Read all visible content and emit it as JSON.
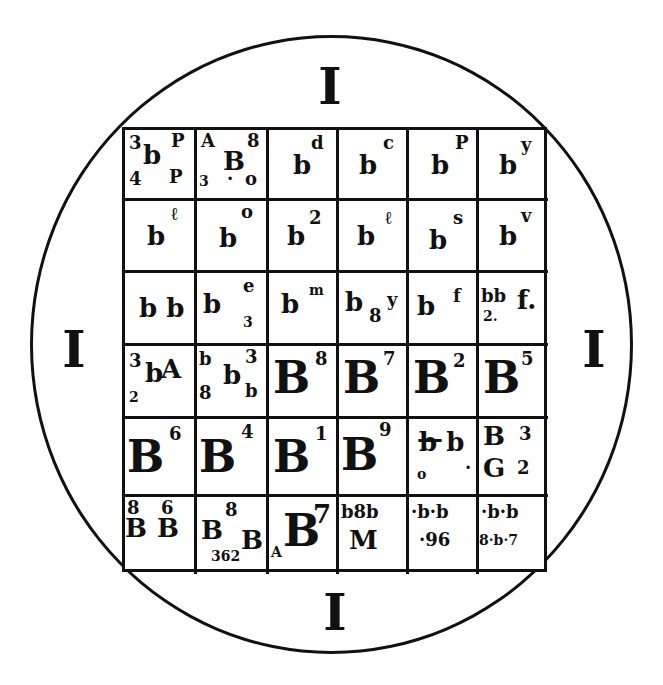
{
  "diagram": {
    "type": "magic-square-seal",
    "outer_shape": "circle",
    "markers": {
      "top": "I",
      "left": "I",
      "right": "I",
      "bottom": "I"
    },
    "grid": {
      "rows": 6,
      "cols": 6,
      "cells": [
        [
          {
            "glyphs": [
              {
                "t": "3",
                "x": 4,
                "y": 4,
                "s": "s-sm"
              },
              {
                "t": "b",
                "x": 18,
                "y": 12,
                "s": "s-mid"
              },
              {
                "t": "P",
                "x": 46,
                "y": 2,
                "s": "s-sm"
              },
              {
                "t": "4",
                "x": 4,
                "y": 40,
                "s": "s-sm"
              },
              {
                "t": "P",
                "x": 44,
                "y": 38,
                "s": "s-sm"
              }
            ]
          },
          {
            "glyphs": [
              {
                "t": "A",
                "x": 4,
                "y": 2,
                "s": "s-sm"
              },
              {
                "t": "8",
                "x": 50,
                "y": 2,
                "s": "s-sm"
              },
              {
                "t": "B",
                "x": 26,
                "y": 18,
                "s": "s-mid"
              },
              {
                "t": "3",
                "x": 2,
                "y": 44,
                "s": "s-xs"
              },
              {
                "t": "·",
                "x": 30,
                "y": 40,
                "s": "s-sm"
              },
              {
                "t": "o",
                "x": 48,
                "y": 40,
                "s": "s-sm"
              }
            ]
          },
          {
            "glyphs": [
              {
                "t": "b",
                "x": 24,
                "y": 22,
                "s": "s-mid"
              },
              {
                "t": "d",
                "x": 42,
                "y": 4,
                "s": "s-sm"
              }
            ]
          },
          {
            "glyphs": [
              {
                "t": "b",
                "x": 20,
                "y": 22,
                "s": "s-mid"
              },
              {
                "t": "c",
                "x": 44,
                "y": 4,
                "s": "s-sm"
              }
            ]
          },
          {
            "glyphs": [
              {
                "t": "b",
                "x": 22,
                "y": 22,
                "s": "s-mid"
              },
              {
                "t": "P",
                "x": 46,
                "y": 4,
                "s": "s-sm"
              }
            ]
          },
          {
            "glyphs": [
              {
                "t": "b",
                "x": 20,
                "y": 22,
                "s": "s-mid"
              },
              {
                "t": "y",
                "x": 42,
                "y": 6,
                "s": "s-sm"
              }
            ]
          }
        ],
        [
          {
            "glyphs": [
              {
                "t": "b",
                "x": 22,
                "y": 22,
                "s": "s-mid"
              },
              {
                "t": "ℓ",
                "x": 46,
                "y": 4,
                "s": "s-sm"
              }
            ]
          },
          {
            "glyphs": [
              {
                "t": "b",
                "x": 22,
                "y": 24,
                "s": "s-mid"
              },
              {
                "t": "o",
                "x": 44,
                "y": 2,
                "s": "s-sm"
              }
            ]
          },
          {
            "glyphs": [
              {
                "t": "b",
                "x": 18,
                "y": 22,
                "s": "s-mid"
              },
              {
                "t": "2",
                "x": 40,
                "y": 8,
                "s": "s-sm"
              }
            ]
          },
          {
            "glyphs": [
              {
                "t": "b",
                "x": 18,
                "y": 22,
                "s": "s-mid"
              },
              {
                "t": "ℓ",
                "x": 46,
                "y": 8,
                "s": "s-sm"
              }
            ]
          },
          {
            "glyphs": [
              {
                "t": "b",
                "x": 20,
                "y": 26,
                "s": "s-mid"
              },
              {
                "t": "s",
                "x": 44,
                "y": 8,
                "s": "s-sm"
              }
            ]
          },
          {
            "glyphs": [
              {
                "t": "b",
                "x": 20,
                "y": 22,
                "s": "s-mid"
              },
              {
                "t": "v",
                "x": 42,
                "y": 6,
                "s": "s-sm"
              }
            ]
          }
        ],
        [
          {
            "glyphs": [
              {
                "t": "b b",
                "x": 14,
                "y": 22,
                "s": "s-mid"
              }
            ]
          },
          {
            "glyphs": [
              {
                "t": "b",
                "x": 6,
                "y": 18,
                "s": "s-mid"
              },
              {
                "t": "e",
                "x": 46,
                "y": 4,
                "s": "s-sm"
              },
              {
                "t": "3",
                "x": 46,
                "y": 42,
                "s": "s-xs"
              }
            ]
          },
          {
            "glyphs": [
              {
                "t": "b",
                "x": 12,
                "y": 18,
                "s": "s-mid"
              },
              {
                "t": "m",
                "x": 40,
                "y": 10,
                "s": "s-xs"
              }
            ]
          },
          {
            "glyphs": [
              {
                "t": "b",
                "x": 6,
                "y": 16,
                "s": "s-mid"
              },
              {
                "t": "8",
                "x": 30,
                "y": 34,
                "s": "s-sm"
              },
              {
                "t": "y",
                "x": 48,
                "y": 18,
                "s": "s-sm"
              }
            ]
          },
          {
            "glyphs": [
              {
                "t": "b",
                "x": 8,
                "y": 20,
                "s": "s-mid"
              },
              {
                "t": "f",
                "x": 44,
                "y": 14,
                "s": "s-sm"
              }
            ]
          },
          {
            "glyphs": [
              {
                "t": "bb",
                "x": 2,
                "y": 14,
                "s": "s-sm"
              },
              {
                "t": "f.",
                "x": 38,
                "y": 14,
                "s": "s-mid"
              },
              {
                "t": "2.",
                "x": 4,
                "y": 36,
                "s": "s-xs"
              }
            ]
          }
        ],
        [
          {
            "glyphs": [
              {
                "t": "3",
                "x": 4,
                "y": 6,
                "s": "s-sm"
              },
              {
                "t": "b",
                "x": 20,
                "y": 14,
                "s": "s-mid"
              },
              {
                "t": "A",
                "x": 36,
                "y": 10,
                "s": "s-mid"
              },
              {
                "t": "2",
                "x": 4,
                "y": 44,
                "s": "s-xs"
              }
            ]
          },
          {
            "glyphs": [
              {
                "t": "b",
                "x": 2,
                "y": 4,
                "s": "s-sm"
              },
              {
                "t": "8",
                "x": 2,
                "y": 38,
                "s": "s-sm"
              },
              {
                "t": "b",
                "x": 26,
                "y": 16,
                "s": "s-mid"
              },
              {
                "t": "3",
                "x": 48,
                "y": 2,
                "s": "s-sm"
              },
              {
                "t": "b",
                "x": 48,
                "y": 36,
                "s": "s-sm"
              }
            ]
          },
          {
            "glyphs": [
              {
                "t": "B",
                "x": 4,
                "y": 10,
                "s": "s-big"
              },
              {
                "t": "8",
                "x": 46,
                "y": 4,
                "s": "s-sm"
              }
            ]
          },
          {
            "glyphs": [
              {
                "t": "B",
                "x": 4,
                "y": 10,
                "s": "s-big"
              },
              {
                "t": "7",
                "x": 44,
                "y": 4,
                "s": "s-sm"
              }
            ]
          },
          {
            "glyphs": [
              {
                "t": "B",
                "x": 4,
                "y": 10,
                "s": "s-big"
              },
              {
                "t": "2",
                "x": 44,
                "y": 6,
                "s": "s-sm"
              }
            ]
          },
          {
            "glyphs": [
              {
                "t": "B",
                "x": 4,
                "y": 10,
                "s": "s-big"
              },
              {
                "t": "5",
                "x": 42,
                "y": 4,
                "s": "s-sm"
              }
            ]
          }
        ],
        [
          {
            "glyphs": [
              {
                "t": "B",
                "x": 2,
                "y": 16,
                "s": "s-big"
              },
              {
                "t": "6",
                "x": 44,
                "y": 6,
                "s": "s-sm"
              }
            ]
          },
          {
            "glyphs": [
              {
                "t": "B",
                "x": 2,
                "y": 16,
                "s": "s-big"
              },
              {
                "t": "4",
                "x": 44,
                "y": 4,
                "s": "s-sm"
              }
            ]
          },
          {
            "glyphs": [
              {
                "t": "B",
                "x": 4,
                "y": 16,
                "s": "s-big"
              },
              {
                "t": "1",
                "x": 46,
                "y": 6,
                "s": "s-sm"
              }
            ]
          },
          {
            "glyphs": [
              {
                "t": "B",
                "x": 2,
                "y": 14,
                "s": "s-big"
              },
              {
                "t": "9",
                "x": 40,
                "y": 2,
                "s": "s-sm"
              }
            ]
          },
          {
            "glyphs": [
              {
                "t": "b b",
                "x": 10,
                "y": 10,
                "s": "s-mid"
              },
              {
                "t": "—",
                "x": 8,
                "y": 6,
                "s": "s-mid"
              },
              {
                "t": "o",
                "x": 8,
                "y": 48,
                "s": "s-xs"
              },
              {
                "t": "·",
                "x": 56,
                "y": 40,
                "s": "s-sm"
              }
            ]
          },
          {
            "glyphs": [
              {
                "t": "B",
                "x": 4,
                "y": 4,
                "s": "s-mid"
              },
              {
                "t": "3",
                "x": 40,
                "y": 6,
                "s": "s-sm"
              },
              {
                "t": "G",
                "x": 4,
                "y": 36,
                "s": "s-mid"
              },
              {
                "t": "2",
                "x": 38,
                "y": 40,
                "s": "s-sm"
              }
            ]
          }
        ],
        [
          {
            "glyphs": [
              {
                "t": "8",
                "x": 2,
                "y": 2,
                "s": "s-sm"
              },
              {
                "t": "6",
                "x": 36,
                "y": 2,
                "s": "s-sm"
              },
              {
                "t": "B",
                "x": 0,
                "y": 18,
                "s": "s-mid"
              },
              {
                "t": "B",
                "x": 32,
                "y": 18,
                "s": "s-mid"
              }
            ]
          },
          {
            "glyphs": [
              {
                "t": "8",
                "x": 28,
                "y": 4,
                "s": "s-sm"
              },
              {
                "t": "B",
                "x": 4,
                "y": 20,
                "s": "s-mid"
              },
              {
                "t": "B",
                "x": 44,
                "y": 30,
                "s": "s-mid"
              },
              {
                "t": "362",
                "x": 14,
                "y": 52,
                "s": "s-xs"
              }
            ]
          },
          {
            "glyphs": [
              {
                "t": "B",
                "x": 14,
                "y": 12,
                "s": "s-big"
              },
              {
                "t": "7",
                "x": 44,
                "y": 4,
                "s": "s-mid"
              },
              {
                "t": "A",
                "x": 2,
                "y": 48,
                "s": "s-xs"
              }
            ]
          },
          {
            "glyphs": [
              {
                "t": "b8b",
                "x": 2,
                "y": 6,
                "s": "s-sm"
              },
              {
                "t": "M",
                "x": 10,
                "y": 30,
                "s": "s-mid"
              }
            ]
          },
          {
            "glyphs": [
              {
                "t": "·b·b",
                "x": 2,
                "y": 6,
                "s": "s-sm"
              },
              {
                "t": "·96",
                "x": 10,
                "y": 34,
                "s": "s-sm"
              }
            ]
          },
          {
            "glyphs": [
              {
                "t": "·b·b",
                "x": 2,
                "y": 6,
                "s": "s-sm"
              },
              {
                "t": "8·b·7",
                "x": 0,
                "y": 36,
                "s": "s-xs"
              }
            ]
          }
        ]
      ]
    }
  }
}
